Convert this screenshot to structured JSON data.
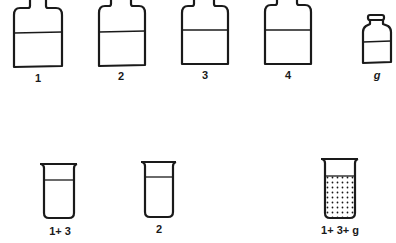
{
  "diagram": {
    "bottles": [
      {
        "label": "1",
        "kind": "large-bottle"
      },
      {
        "label": "2",
        "kind": "large-bottle"
      },
      {
        "label": "3",
        "kind": "large-bottle"
      },
      {
        "label": "4",
        "kind": "large-bottle"
      },
      {
        "label": "g",
        "kind": "small-bottle"
      }
    ],
    "beakers": [
      {
        "label": "1+ 3",
        "contents": "clear"
      },
      {
        "label": "2",
        "contents": "clear"
      },
      {
        "label": "1+ 3+ g",
        "contents": "precipitate"
      }
    ],
    "colors": {
      "stroke": "#1a1a1a",
      "background": "#ffffff"
    }
  }
}
